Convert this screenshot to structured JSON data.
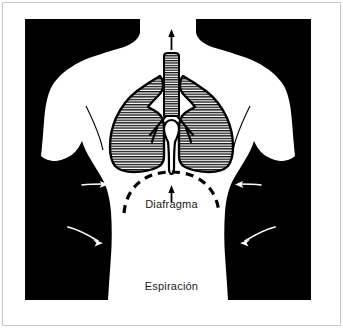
{
  "figure": {
    "panel_background": "#000000",
    "body_fill": "#ffffff",
    "outline_color": "#000000",
    "frame_border_color": "#c9c9c9",
    "page_background": "#ffffff"
  },
  "labels": {
    "diaphragm": "Diafragma",
    "phase": "Espiración"
  },
  "anatomy": {
    "trachea_name": "trachea",
    "left_lung_name": "left lung",
    "right_lung_name": "right lung",
    "bronchi_name": "bronchi",
    "diaphragm_name": "diaphragm",
    "torso_name": "torso silhouette",
    "hatch_color": "#111111",
    "lung_fill": "#ffffff"
  },
  "arrows": {
    "airflow_up": {
      "name": "airflow-up-arrow",
      "color": "#000000",
      "direction": "up"
    },
    "diaphragm_up": {
      "name": "diaphragm-up-arrow",
      "color": "#000000",
      "direction": "up"
    },
    "chest_inward": [
      {
        "name": "chest-arrow-left-upper",
        "color": "#ffffff",
        "direction": "right-inward"
      },
      {
        "name": "chest-arrow-left-lower",
        "color": "#ffffff",
        "direction": "right-inward"
      },
      {
        "name": "chest-arrow-right-upper",
        "color": "#ffffff",
        "direction": "left-inward"
      },
      {
        "name": "chest-arrow-right-lower",
        "color": "#ffffff",
        "direction": "left-inward"
      }
    ]
  }
}
